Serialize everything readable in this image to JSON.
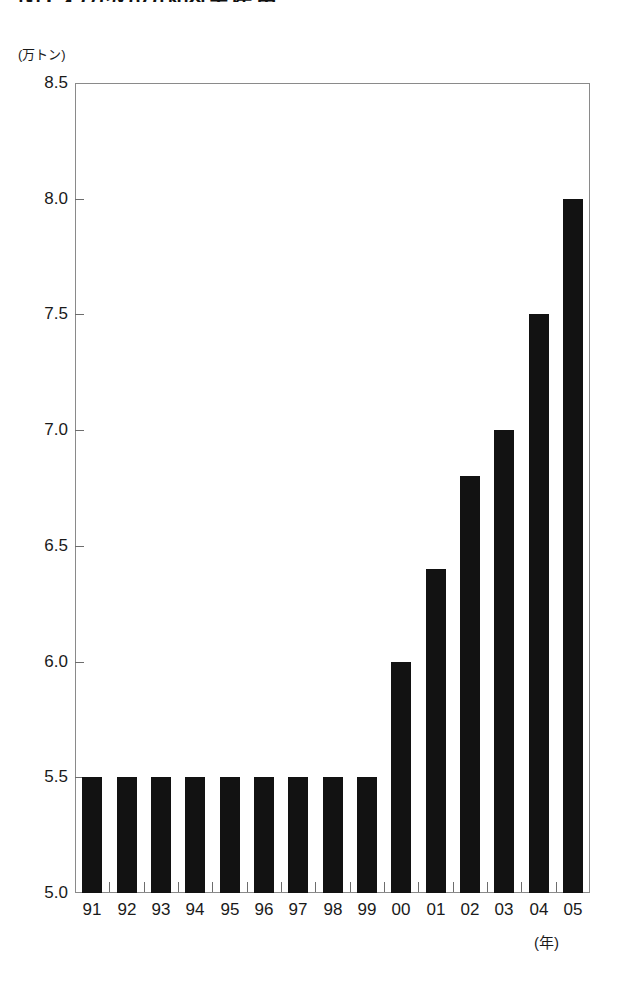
{
  "title": "図1 わかめの国内生産量",
  "y_axis": {
    "unit_label": "(万トン)",
    "ticks": [
      "8.5",
      "8.0",
      "7.5",
      "7.0",
      "6.5",
      "6.0",
      "5.5",
      "5.0"
    ]
  },
  "x_axis": {
    "caption": "(年)",
    "ticks": [
      "91",
      "92",
      "93",
      "94",
      "95",
      "96",
      "97",
      "98",
      "99",
      "00",
      "01",
      "02",
      "03",
      "04",
      "05"
    ]
  },
  "colors": {
    "bar": "#121212",
    "frame": "#8a8a8a",
    "text": "#1a1a1a",
    "background": "#ffffff"
  },
  "chart_data": {
    "type": "bar",
    "title": "図1 わかめの国内生産量",
    "xlabel": "(年)",
    "ylabel": "(万トン)",
    "ylim": [
      5.0,
      8.5
    ],
    "yticks": [
      5.0,
      5.5,
      6.0,
      6.5,
      7.0,
      7.5,
      8.0,
      8.5
    ],
    "grid": false,
    "legend": "none",
    "categories": [
      "91",
      "92",
      "93",
      "94",
      "95",
      "96",
      "97",
      "98",
      "99",
      "00",
      "01",
      "02",
      "03",
      "04",
      "05"
    ],
    "values": [
      5.5,
      5.5,
      5.5,
      5.5,
      5.5,
      5.5,
      5.5,
      5.5,
      5.5,
      6.0,
      6.4,
      6.8,
      7.0,
      7.5,
      8.0
    ]
  }
}
